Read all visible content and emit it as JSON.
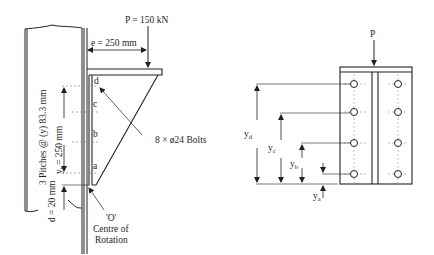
{
  "left_figure": {
    "load_label": "P = 150 kN",
    "eccentricity_label": "e = 250 mm",
    "pitch_label": "3 Pitches @ (y) 83.3 mm",
    "yt_label_main": "y",
    "yt_label_sub": "t",
    "yt_label_value": " = 250 mm",
    "d_label": "d = 20 mm",
    "bolt_row_labels": [
      "d",
      "c",
      "b",
      "a"
    ],
    "bolts_label": "8 × ø24 Bolts",
    "rotation_labels": [
      "'O'",
      "Centre of",
      "Rotation"
    ]
  },
  "right_figure": {
    "load_label": "P",
    "dimension_labels": [
      {
        "main": "y",
        "sub": "d"
      },
      {
        "main": "y",
        "sub": "c"
      },
      {
        "main": "y",
        "sub": "b"
      },
      {
        "main": "y",
        "sub": "a"
      }
    ]
  },
  "colors": {
    "line": "#231f20",
    "dashed": "#8a8a8a",
    "background": "#ffffff"
  }
}
